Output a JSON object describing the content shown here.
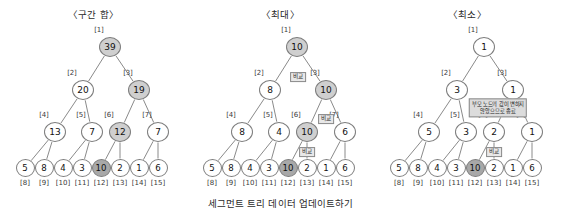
{
  "caption": "세그먼트 트리 데이터 업데이트하기",
  "labels": {
    "compare": "비교",
    "index_prefix": "[",
    "index_suffix": "]"
  },
  "geometry": {
    "panel_width": 187,
    "level_y": [
      47,
      90,
      132,
      168
    ],
    "level1_x": [
      110
    ],
    "level2_x": [
      83,
      139
    ],
    "level3_x": [
      55,
      92,
      120,
      158
    ],
    "leaf_x": [
      25,
      44,
      63,
      82,
      101,
      120,
      139,
      158
    ]
  },
  "panels": [
    {
      "id": "interval-sum",
      "title": "〈구간 합〉",
      "nodes": [
        {
          "index": "[1]",
          "value": "39",
          "level": 0,
          "slot": 0,
          "fill": "mid"
        },
        {
          "index": "[2]",
          "value": "20",
          "level": 1,
          "slot": 0,
          "fill": "light"
        },
        {
          "index": "[3]",
          "value": "19",
          "level": 1,
          "slot": 1,
          "fill": "mid"
        },
        {
          "index": "[4]",
          "value": "13",
          "level": 2,
          "slot": 0,
          "fill": "light"
        },
        {
          "index": "[5]",
          "value": "7",
          "level": 2,
          "slot": 1,
          "fill": "light"
        },
        {
          "index": "[6]",
          "value": "12",
          "level": 2,
          "slot": 2,
          "fill": "mid"
        },
        {
          "index": "[7]",
          "value": "7",
          "level": 2,
          "slot": 3,
          "fill": "light"
        },
        {
          "index": "[8]",
          "value": "5",
          "level": 3,
          "slot": 0,
          "fill": "light"
        },
        {
          "index": "[9]",
          "value": "8",
          "level": 3,
          "slot": 1,
          "fill": "light"
        },
        {
          "index": "[10]",
          "value": "4",
          "level": 3,
          "slot": 2,
          "fill": "light"
        },
        {
          "index": "[11]",
          "value": "3",
          "level": 3,
          "slot": 3,
          "fill": "light"
        },
        {
          "index": "[12]",
          "value": "10",
          "level": 3,
          "slot": 4,
          "fill": "dark"
        },
        {
          "index": "[13]",
          "value": "2",
          "level": 3,
          "slot": 5,
          "fill": "light"
        },
        {
          "index": "[14]",
          "value": "1",
          "level": 3,
          "slot": 6,
          "fill": "light"
        },
        {
          "index": "[15]",
          "value": "6",
          "level": 3,
          "slot": 7,
          "fill": "light"
        }
      ],
      "tags": [],
      "notes": []
    },
    {
      "id": "maximum",
      "title": "〈최대〉",
      "nodes": [
        {
          "index": "[1]",
          "value": "10",
          "level": 0,
          "slot": 0,
          "fill": "mid"
        },
        {
          "index": "[2]",
          "value": "8",
          "level": 1,
          "slot": 0,
          "fill": "light"
        },
        {
          "index": "[3]",
          "value": "10",
          "level": 1,
          "slot": 1,
          "fill": "mid"
        },
        {
          "index": "[4]",
          "value": "8",
          "level": 2,
          "slot": 0,
          "fill": "light"
        },
        {
          "index": "[5]",
          "value": "4",
          "level": 2,
          "slot": 1,
          "fill": "light"
        },
        {
          "index": "[6]",
          "value": "10",
          "level": 2,
          "slot": 2,
          "fill": "mid"
        },
        {
          "index": "[7]",
          "value": "6",
          "level": 2,
          "slot": 3,
          "fill": "light"
        },
        {
          "index": "[8]",
          "value": "5",
          "level": 3,
          "slot": 0,
          "fill": "light"
        },
        {
          "index": "[9]",
          "value": "8",
          "level": 3,
          "slot": 1,
          "fill": "light"
        },
        {
          "index": "[10]",
          "value": "4",
          "level": 3,
          "slot": 2,
          "fill": "light"
        },
        {
          "index": "[11]",
          "value": "3",
          "level": 3,
          "slot": 3,
          "fill": "light"
        },
        {
          "index": "[12]",
          "value": "10",
          "level": 3,
          "slot": 4,
          "fill": "dark"
        },
        {
          "index": "[13]",
          "value": "2",
          "level": 3,
          "slot": 5,
          "fill": "light"
        },
        {
          "index": "[14]",
          "value": "1",
          "level": 3,
          "slot": 6,
          "fill": "light"
        },
        {
          "index": "[15]",
          "value": "6",
          "level": 3,
          "slot": 7,
          "fill": "light"
        }
      ],
      "tags": [
        {
          "text": "비교",
          "x": 111,
          "y": 77
        },
        {
          "text": "비교",
          "x": 139,
          "y": 119
        },
        {
          "text": "비교",
          "x": 120,
          "y": 152
        }
      ],
      "notes": []
    },
    {
      "id": "minimum",
      "title": "〈최소〉",
      "nodes": [
        {
          "index": "[1]",
          "value": "1",
          "level": 0,
          "slot": 0,
          "fill": "light"
        },
        {
          "index": "[2]",
          "value": "3",
          "level": 1,
          "slot": 0,
          "fill": "light"
        },
        {
          "index": "[3]",
          "value": "1",
          "level": 1,
          "slot": 1,
          "fill": "light"
        },
        {
          "index": "[4]",
          "value": "5",
          "level": 2,
          "slot": 0,
          "fill": "light"
        },
        {
          "index": "[5]",
          "value": "3",
          "level": 2,
          "slot": 1,
          "fill": "light"
        },
        {
          "index": "[6]",
          "value": "2",
          "level": 2,
          "slot": 2,
          "fill": "light"
        },
        {
          "index": "[7]",
          "value": "1",
          "level": 2,
          "slot": 3,
          "fill": "light"
        },
        {
          "index": "[8]",
          "value": "5",
          "level": 3,
          "slot": 0,
          "fill": "light"
        },
        {
          "index": "[9]",
          "value": "8",
          "level": 3,
          "slot": 1,
          "fill": "light"
        },
        {
          "index": "[10]",
          "value": "4",
          "level": 3,
          "slot": 2,
          "fill": "light"
        },
        {
          "index": "[11]",
          "value": "3",
          "level": 3,
          "slot": 3,
          "fill": "light"
        },
        {
          "index": "[12]",
          "value": "10",
          "level": 3,
          "slot": 4,
          "fill": "dark"
        },
        {
          "index": "[13]",
          "value": "2",
          "level": 3,
          "slot": 5,
          "fill": "light"
        },
        {
          "index": "[14]",
          "value": "1",
          "level": 3,
          "slot": 6,
          "fill": "light"
        },
        {
          "index": "[15]",
          "value": "6",
          "level": 3,
          "slot": 7,
          "fill": "light"
        }
      ],
      "tags": [
        {
          "text": "비교",
          "x": 120,
          "y": 152
        }
      ],
      "notes": [
        {
          "line1": "부모 노드의 값이 변하지",
          "line2": "않았으므로 종료",
          "x": 124,
          "y": 108
        }
      ]
    }
  ]
}
